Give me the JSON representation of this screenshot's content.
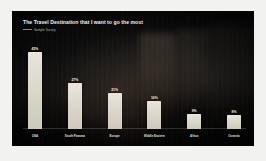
{
  "slide": {
    "background_color": "#060606",
    "frame_color": "#f2f2f0",
    "bar_color": "#e0dbcf",
    "text_color": "#f4f2ee"
  },
  "header": {
    "title": "The Travel Destination that I want to go the most",
    "subtitle": "Sample Survey"
  },
  "chart_data": {
    "type": "bar",
    "title": "The Travel Destination that I want to go the most",
    "subtitle": "Sample Survey",
    "categories": [
      "USA",
      "South Panama",
      "Europe",
      "Middle Eastern",
      "Africa",
      "Oceania"
    ],
    "values": [
      45,
      27,
      21,
      16,
      9,
      8
    ],
    "value_labels": [
      "45%",
      "27%",
      "21%",
      "16%",
      "9%",
      "8%"
    ],
    "xlabel": "",
    "ylabel": "",
    "ylim": [
      0,
      50
    ],
    "grid": false,
    "legend": false,
    "orientation": "vertical"
  }
}
